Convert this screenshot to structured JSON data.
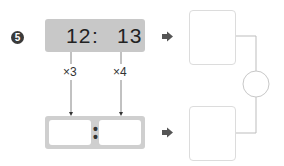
{
  "problem": {
    "number": "5",
    "ratio": {
      "left": "12",
      "separator": ":",
      "right": "13"
    },
    "multipliers": {
      "left": "×3",
      "right": "×4"
    },
    "answer": {
      "separator": ":",
      "left_value": "",
      "right_value": ""
    },
    "result_boxes": {
      "top_value": "",
      "bottom_value": "",
      "compare_value": ""
    }
  },
  "colors": {
    "badge": "#3a3a3a",
    "ratio_box": "#c8c8c8",
    "answer_box": "#cfcfcf",
    "arrow": "#555555",
    "lines": "#b5b5b5",
    "result_border": "#dcdcdc"
  }
}
